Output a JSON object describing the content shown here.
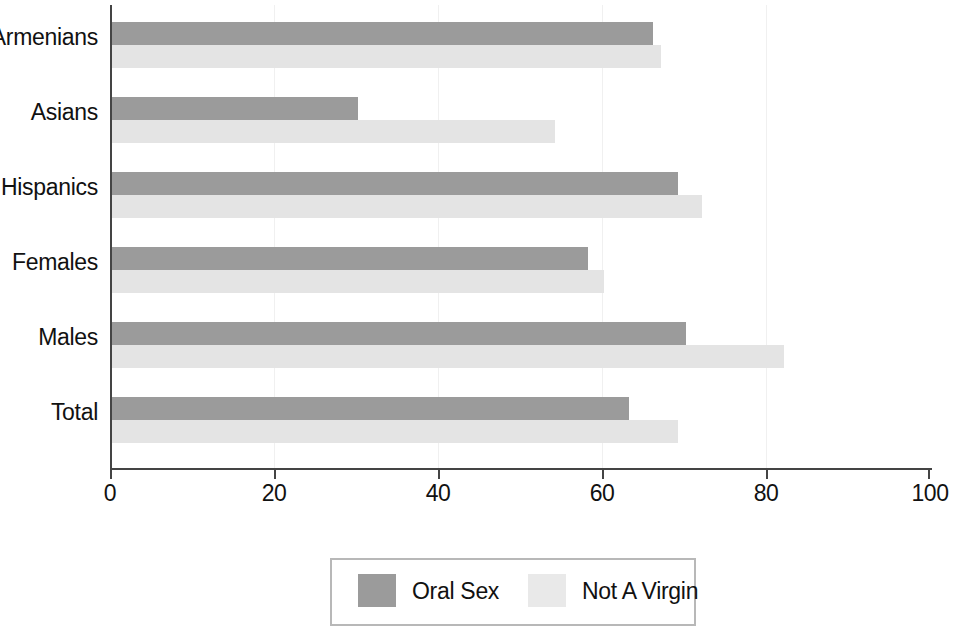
{
  "chart_data": {
    "type": "bar",
    "orientation": "horizontal",
    "title": "",
    "subtitle": "",
    "xlabel": "",
    "ylabel": "",
    "xlim": [
      0,
      100
    ],
    "xticks": [
      0,
      20,
      40,
      60,
      80,
      100
    ],
    "xtick_labels": [
      "0",
      "20",
      "40",
      "60",
      "80",
      "100"
    ],
    "grid": true,
    "grid_axis": "x",
    "legend_position": "bottom-center",
    "categories": [
      "Armenians",
      "Asians",
      "Hispanics",
      "Females",
      "Males",
      "Total"
    ],
    "series": [
      {
        "name": "Oral Sex",
        "color": "#9b9b9b",
        "values": [
          66,
          30,
          69,
          58,
          70,
          63
        ]
      },
      {
        "name": "Not A Virgin",
        "color": "#e4e4e4",
        "values": [
          67,
          54,
          72,
          60,
          82,
          69
        ]
      }
    ]
  },
  "legend": {
    "entries": [
      {
        "label": "Oral Sex",
        "swatch_color": "#9b9b9b"
      },
      {
        "label": "Not A Virgin",
        "swatch_color": "#e9e9e9"
      }
    ]
  },
  "axis": {
    "axis_color": "#444444",
    "gridline_color": "#f0f0f0"
  }
}
